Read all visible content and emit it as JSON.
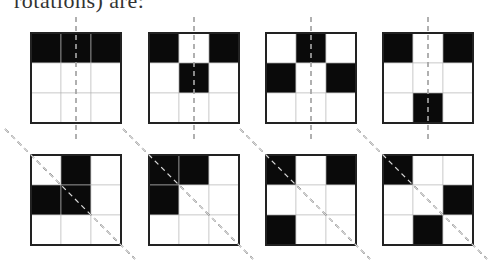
{
  "caption": "rotations) are:",
  "colors": {
    "filled": "#0a0a0a",
    "empty": "#ffffff",
    "border": "#222222",
    "grid": "#bbbbbb",
    "axis": "#333333"
  },
  "rows": [
    {
      "axis": "vertical",
      "figures": [
        {
          "x": 31,
          "y": 33,
          "cells": [
            [
              1,
              1,
              1
            ],
            [
              0,
              0,
              0
            ],
            [
              0,
              0,
              0
            ]
          ]
        },
        {
          "x": 149,
          "y": 33,
          "cells": [
            [
              1,
              0,
              1
            ],
            [
              0,
              1,
              0
            ],
            [
              0,
              0,
              0
            ]
          ]
        },
        {
          "x": 266,
          "y": 33,
          "cells": [
            [
              0,
              1,
              0
            ],
            [
              1,
              0,
              1
            ],
            [
              0,
              0,
              0
            ]
          ]
        },
        {
          "x": 383,
          "y": 33,
          "cells": [
            [
              1,
              0,
              1
            ],
            [
              0,
              0,
              0
            ],
            [
              0,
              1,
              0
            ]
          ]
        }
      ]
    },
    {
      "axis": "diagonal",
      "figures": [
        {
          "x": 31,
          "y": 155,
          "cells": [
            [
              0,
              1,
              0
            ],
            [
              1,
              1,
              0
            ],
            [
              0,
              0,
              0
            ]
          ]
        },
        {
          "x": 149,
          "y": 155,
          "cells": [
            [
              1,
              1,
              0
            ],
            [
              1,
              0,
              0
            ],
            [
              0,
              0,
              0
            ]
          ]
        },
        {
          "x": 266,
          "y": 155,
          "cells": [
            [
              1,
              0,
              1
            ],
            [
              0,
              0,
              0
            ],
            [
              1,
              0,
              0
            ]
          ]
        },
        {
          "x": 383,
          "y": 155,
          "cells": [
            [
              1,
              0,
              0
            ],
            [
              0,
              0,
              1
            ],
            [
              0,
              1,
              0
            ]
          ]
        }
      ]
    }
  ]
}
